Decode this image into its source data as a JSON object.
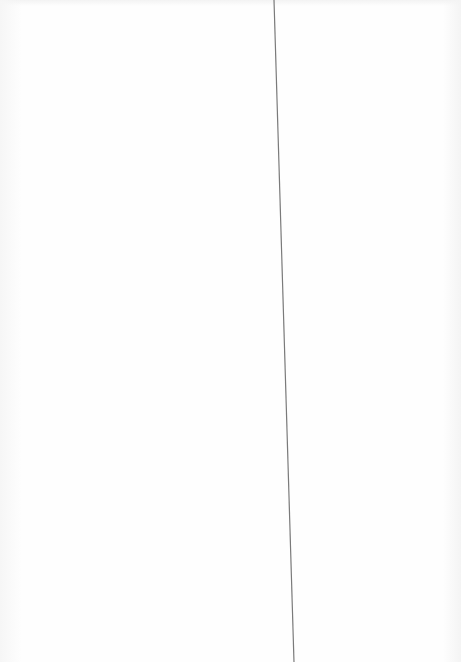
{
  "page": {
    "background_color": "#fefefe",
    "edge_shade_color": "#f4f4f4"
  },
  "rule": {
    "x1": 274,
    "y1": 0,
    "x2": 294,
    "y2": 662,
    "color": "#7a7a7a",
    "width": 1.2
  }
}
